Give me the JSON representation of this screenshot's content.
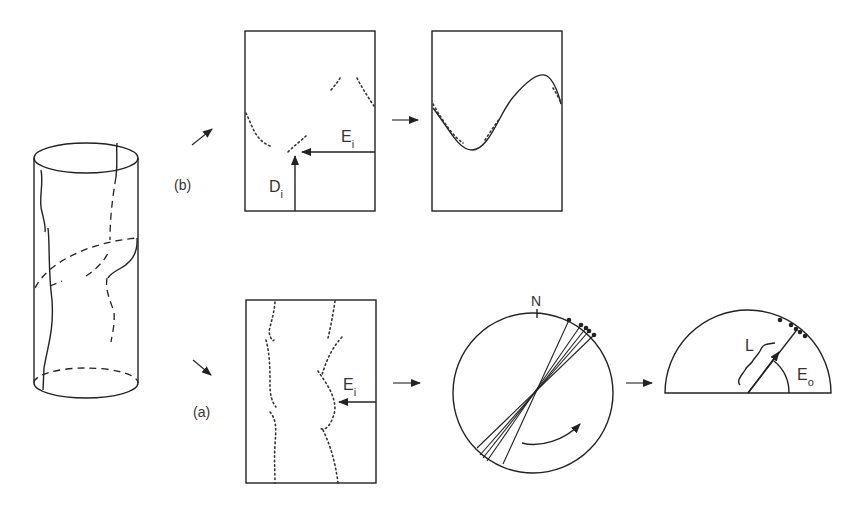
{
  "figure": {
    "panels": {
      "b": {
        "label": "(b)",
        "unrolled_trace_box": {
          "labels": {
            "E": "E",
            "E_sub": "i",
            "D": "D",
            "D_sub": "i"
          }
        },
        "sinusoid_fit_box": {}
      },
      "a": {
        "label": "(a)",
        "unrolled_trace_box": {
          "labels": {
            "E": "E",
            "E_sub": "i"
          }
        },
        "stereonet": {
          "north_label": "N"
        },
        "half_circle": {
          "labels": {
            "L": "L",
            "E": "E",
            "E_sub": "o"
          }
        }
      }
    },
    "colors": {
      "line": "#222222",
      "text": "#333333",
      "background": "#ffffff"
    }
  }
}
